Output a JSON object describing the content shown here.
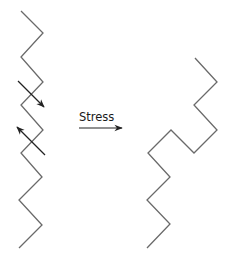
{
  "diagram": {
    "label": "Stress",
    "colors": {
      "chain": "#6a6a6a",
      "arrow": "#222222",
      "background": "#ffffff"
    },
    "left_chain": {
      "description": "Straight zigzag chain before stress",
      "points": [
        [
          21,
          11
        ],
        [
          43,
          33
        ],
        [
          21,
          57
        ],
        [
          43,
          82
        ],
        [
          21,
          105
        ],
        [
          43,
          130
        ],
        [
          21,
          153
        ],
        [
          42,
          177
        ],
        [
          19,
          200
        ],
        [
          42,
          225
        ],
        [
          19,
          248
        ]
      ]
    },
    "force_arrows": [
      {
        "from": [
          18,
          81
        ],
        "to": [
          44,
          107
        ],
        "direction": "down-right"
      },
      {
        "from": [
          45,
          155
        ],
        "to": [
          17,
          127
        ],
        "direction": "up-left"
      }
    ],
    "stress_arrow": {
      "from": [
        79,
        128
      ],
      "to": [
        122,
        128
      ]
    },
    "right_chain": {
      "description": "Deformed zigzag chain after stress",
      "points": [
        [
          195,
          58
        ],
        [
          217,
          82
        ],
        [
          194,
          105
        ],
        [
          217,
          130
        ],
        [
          194,
          153
        ],
        [
          171,
          130
        ],
        [
          148,
          153
        ],
        [
          170,
          177
        ],
        [
          147,
          200
        ],
        [
          170,
          224
        ],
        [
          147,
          248
        ]
      ]
    }
  }
}
